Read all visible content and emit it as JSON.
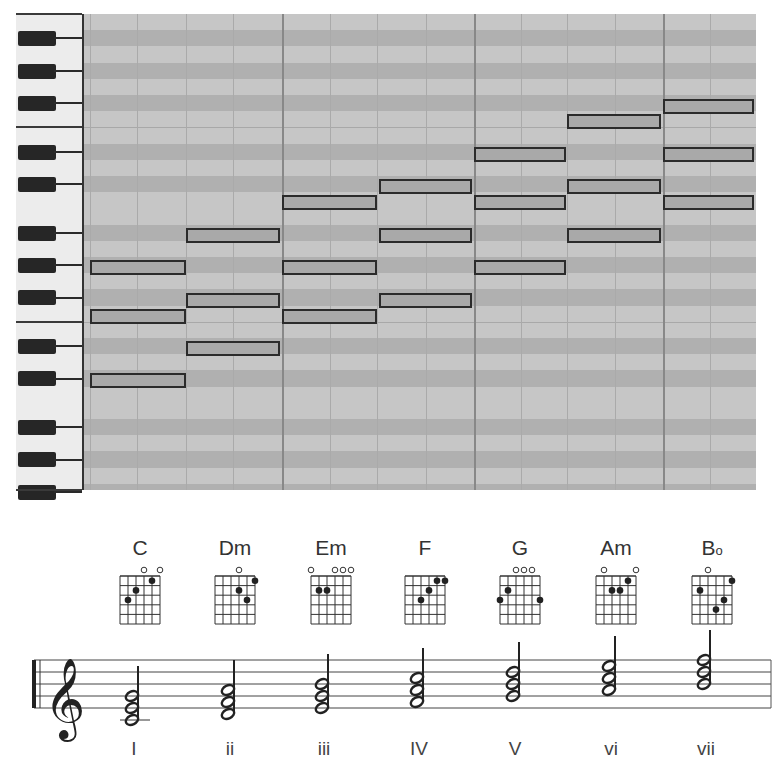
{
  "piano_roll": {
    "row_height": 16.2,
    "rows": 30,
    "black_key_rows": [
      1,
      3,
      5,
      8,
      10,
      13,
      15,
      17,
      20,
      22,
      25,
      27,
      29
    ],
    "white_boundary_rows": [
      7,
      19
    ],
    "columns": [
      6,
      53,
      102,
      149,
      198,
      246,
      293,
      342,
      390,
      437,
      483,
      531,
      579,
      626,
      672
    ],
    "bar_columns": [
      198,
      390,
      579
    ],
    "colors": {
      "grid_light": "#c6c6c6",
      "grid_dark": "#b0b0b0",
      "note_fill": "#a9a9a9",
      "note_border": "#2b2b2b"
    },
    "chords": [
      {
        "name": "C",
        "x": 6,
        "w": 96,
        "notes": [
          {
            "y": 260
          },
          {
            "y": 309
          },
          {
            "y": 373
          }
        ]
      },
      {
        "name": "Dm",
        "x": 102,
        "w": 94,
        "notes": [
          {
            "y": 228
          },
          {
            "y": 293
          },
          {
            "y": 341
          }
        ]
      },
      {
        "name": "Em",
        "x": 198,
        "w": 95,
        "notes": [
          {
            "y": 195
          },
          {
            "y": 260
          },
          {
            "y": 309
          }
        ]
      },
      {
        "name": "F",
        "x": 295,
        "w": 93,
        "notes": [
          {
            "y": 179
          },
          {
            "y": 228
          },
          {
            "y": 293
          }
        ]
      },
      {
        "name": "G",
        "x": 390,
        "w": 92,
        "notes": [
          {
            "y": 147
          },
          {
            "y": 195
          },
          {
            "y": 260
          }
        ]
      },
      {
        "name": "Am",
        "x": 483,
        "w": 94,
        "notes": [
          {
            "y": 114
          },
          {
            "y": 179
          },
          {
            "y": 228
          }
        ]
      },
      {
        "name": "B°",
        "x": 579,
        "w": 91,
        "notes": [
          {
            "y": 99
          },
          {
            "y": 147
          },
          {
            "y": 195
          }
        ]
      }
    ]
  },
  "guitar_chords": [
    {
      "label": "C",
      "center_x": 140,
      "open": [
        4,
        6
      ],
      "muted": [],
      "dots": [
        [
          2,
          3
        ],
        [
          3,
          2
        ],
        [
          5,
          1
        ]
      ]
    },
    {
      "label": "Dm",
      "center_x": 235,
      "open": [
        4
      ],
      "muted": [],
      "dots": [
        [
          4,
          2
        ],
        [
          5,
          3
        ],
        [
          6,
          1
        ]
      ]
    },
    {
      "label": "Em",
      "center_x": 331,
      "open": [
        1,
        4,
        5,
        6
      ],
      "muted": [],
      "dots": [
        [
          2,
          2
        ],
        [
          3,
          2
        ]
      ]
    },
    {
      "label": "F",
      "center_x": 425,
      "open": [],
      "muted": [],
      "dots": [
        [
          3,
          3
        ],
        [
          4,
          2
        ],
        [
          5,
          1
        ],
        [
          6,
          1
        ]
      ]
    },
    {
      "label": "G",
      "center_x": 520,
      "open": [
        3,
        4,
        5
      ],
      "muted": [],
      "dots": [
        [
          1,
          3
        ],
        [
          2,
          2
        ],
        [
          6,
          3
        ]
      ]
    },
    {
      "label": "Am",
      "center_x": 616,
      "open": [
        2,
        6
      ],
      "muted": [],
      "dots": [
        [
          3,
          2
        ],
        [
          4,
          2
        ],
        [
          5,
          1
        ]
      ]
    },
    {
      "label": "B",
      "label_suffix": "o",
      "center_x": 712,
      "open": [
        3
      ],
      "muted": [],
      "dots": [
        [
          2,
          2
        ],
        [
          4,
          4
        ],
        [
          5,
          3
        ],
        [
          6,
          1
        ]
      ]
    }
  ],
  "staff": {
    "top": 660,
    "line_spacing": 12,
    "left": 34,
    "right": 771,
    "clef": "treble-clef",
    "chords": [
      {
        "roman": "I",
        "x": 137,
        "bottom_step": -2,
        "ledger": true
      },
      {
        "roman": "ii",
        "x": 233,
        "bottom_step": -1,
        "ledger": false
      },
      {
        "roman": "iii",
        "x": 327,
        "bottom_step": 0,
        "ledger": false
      },
      {
        "roman": "IV",
        "x": 422,
        "bottom_step": 1,
        "ledger": false
      },
      {
        "roman": "V",
        "x": 518,
        "bottom_step": 2,
        "ledger": false
      },
      {
        "roman": "vi",
        "x": 614,
        "bottom_step": 3,
        "ledger": false
      },
      {
        "roman": "vii",
        "x": 709,
        "bottom_step": 4,
        "ledger": false
      }
    ]
  }
}
